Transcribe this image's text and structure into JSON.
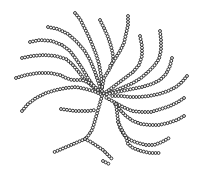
{
  "image": {
    "description": "Branched bead-chain (dendritic polymer) illustration on white background",
    "width": 202,
    "height": 170,
    "background": "#ffffff",
    "bead_stroke": "#2a2a2a",
    "bead_fill": "#ffffff",
    "bead_radius": 1.45,
    "bead_spacing": 3.0
  },
  "hub": [
    102,
    95
  ],
  "chains": [
    {
      "name": "upper-left-arc-1",
      "points": [
        [
          48,
          27
        ],
        [
          58,
          29
        ],
        [
          68,
          34
        ],
        [
          76,
          41
        ],
        [
          84,
          50
        ],
        [
          90,
          60
        ],
        [
          95,
          72
        ],
        [
          99,
          84
        ],
        [
          102,
          94
        ]
      ]
    },
    {
      "name": "upper-left-arc-2",
      "points": [
        [
          30,
          42
        ],
        [
          40,
          40
        ],
        [
          52,
          41
        ],
        [
          62,
          45
        ],
        [
          70,
          51
        ],
        [
          76,
          59
        ],
        [
          82,
          68
        ],
        [
          88,
          78
        ],
        [
          94,
          87
        ],
        [
          101,
          94
        ]
      ]
    },
    {
      "name": "upper-left-arc-3",
      "points": [
        [
          22,
          58
        ],
        [
          32,
          56
        ],
        [
          44,
          55
        ],
        [
          56,
          56
        ],
        [
          66,
          59
        ],
        [
          72,
          64
        ],
        [
          78,
          71
        ],
        [
          84,
          79
        ],
        [
          92,
          86
        ],
        [
          100,
          93
        ]
      ]
    },
    {
      "name": "upper-left-arc-4",
      "points": [
        [
          16,
          78
        ],
        [
          26,
          75
        ],
        [
          38,
          73
        ],
        [
          50,
          73
        ],
        [
          60,
          75
        ],
        [
          66,
          78
        ],
        [
          72,
          80
        ],
        [
          82,
          80
        ],
        [
          92,
          84
        ],
        [
          100,
          92
        ]
      ]
    },
    {
      "name": "lower-left-arc",
      "points": [
        [
          22,
          111
        ],
        [
          28,
          104
        ],
        [
          36,
          98
        ],
        [
          46,
          93
        ],
        [
          56,
          90
        ],
        [
          66,
          88
        ],
        [
          76,
          87
        ],
        [
          86,
          89
        ],
        [
          96,
          92
        ],
        [
          102,
          95
        ]
      ]
    },
    {
      "name": "top-chain-1",
      "points": [
        [
          75,
          13
        ],
        [
          80,
          19
        ],
        [
          84,
          27
        ],
        [
          88,
          35
        ],
        [
          92,
          44
        ],
        [
          96,
          54
        ],
        [
          99,
          64
        ],
        [
          101,
          75
        ],
        [
          102,
          86
        ],
        [
          102,
          94
        ]
      ]
    },
    {
      "name": "top-chain-2",
      "points": [
        [
          100,
          20
        ],
        [
          104,
          28
        ],
        [
          108,
          37
        ],
        [
          111,
          46
        ],
        [
          113,
          55
        ],
        [
          113,
          62
        ],
        [
          109,
          70
        ],
        [
          104,
          78
        ],
        [
          102,
          88
        ]
      ]
    },
    {
      "name": "top-chain-3",
      "points": [
        [
          128,
          16
        ],
        [
          128,
          25
        ],
        [
          126,
          34
        ],
        [
          124,
          43
        ],
        [
          120,
          51
        ],
        [
          115,
          59
        ],
        [
          110,
          66
        ]
      ]
    },
    {
      "name": "top-chain-4",
      "points": [
        [
          140,
          36
        ],
        [
          142,
          46
        ],
        [
          142,
          56
        ],
        [
          139,
          65
        ],
        [
          133,
          72
        ],
        [
          125,
          78
        ],
        [
          117,
          84
        ],
        [
          109,
          90
        ],
        [
          103,
          94
        ]
      ]
    },
    {
      "name": "top-chain-5",
      "points": [
        [
          160,
          31
        ],
        [
          161,
          40
        ],
        [
          161,
          50
        ],
        [
          159,
          59
        ],
        [
          154,
          66
        ],
        [
          148,
          72
        ],
        [
          141,
          78
        ],
        [
          133,
          83
        ],
        [
          124,
          87
        ],
        [
          114,
          91
        ],
        [
          104,
          95
        ]
      ]
    },
    {
      "name": "right-chain-1",
      "points": [
        [
          172,
          58
        ],
        [
          170,
          66
        ],
        [
          166,
          74
        ],
        [
          160,
          80
        ],
        [
          152,
          84
        ],
        [
          142,
          87
        ],
        [
          132,
          89
        ],
        [
          122,
          91
        ],
        [
          112,
          93
        ],
        [
          104,
          95
        ]
      ]
    },
    {
      "name": "right-chain-2",
      "points": [
        [
          187,
          76
        ],
        [
          182,
          82
        ],
        [
          176,
          87
        ],
        [
          168,
          91
        ],
        [
          159,
          94
        ],
        [
          149,
          96
        ],
        [
          139,
          97
        ],
        [
          130,
          97
        ],
        [
          121,
          96
        ],
        [
          112,
          96
        ]
      ]
    },
    {
      "name": "right-chain-3",
      "points": [
        [
          184,
          98
        ],
        [
          178,
          102
        ],
        [
          170,
          106
        ],
        [
          161,
          109
        ],
        [
          151,
          112
        ],
        [
          141,
          112
        ],
        [
          132,
          111
        ],
        [
          123,
          107
        ],
        [
          114,
          102
        ],
        [
          105,
          97
        ]
      ]
    },
    {
      "name": "right-chain-4",
      "points": [
        [
          184,
          116
        ],
        [
          177,
          120
        ],
        [
          168,
          123
        ],
        [
          159,
          125
        ],
        [
          150,
          125
        ],
        [
          141,
          124
        ],
        [
          133,
          121
        ],
        [
          126,
          116
        ],
        [
          120,
          110
        ],
        [
          115,
          104
        ]
      ]
    },
    {
      "name": "lower-right-chain-1",
      "points": [
        [
          116,
          104
        ],
        [
          117,
          112
        ],
        [
          118,
          120
        ],
        [
          120,
          128
        ],
        [
          124,
          135
        ],
        [
          130,
          140
        ],
        [
          138,
          143
        ],
        [
          146,
          145
        ],
        [
          154,
          145
        ],
        [
          162,
          142
        ],
        [
          169,
          138
        ]
      ]
    },
    {
      "name": "lower-right-chain-2",
      "points": [
        [
          118,
          122
        ],
        [
          122,
          130
        ],
        [
          126,
          137
        ],
        [
          128,
          144
        ],
        [
          133,
          148
        ],
        [
          141,
          151
        ],
        [
          150,
          153
        ],
        [
          160,
          153
        ]
      ]
    },
    {
      "name": "left-middle-chain",
      "points": [
        [
          61,
          109
        ],
        [
          68,
          110
        ],
        [
          75,
          111
        ],
        [
          82,
          111
        ],
        [
          89,
          111
        ],
        [
          95,
          110
        ]
      ]
    },
    {
      "name": "center-down-chain",
      "points": [
        [
          102,
          96
        ],
        [
          100,
          103
        ],
        [
          98,
          110
        ],
        [
          96,
          117
        ],
        [
          94,
          124
        ],
        [
          92,
          130
        ],
        [
          88,
          136
        ],
        [
          85,
          139
        ]
      ]
    },
    {
      "name": "lower-left-branch",
      "points": [
        [
          85,
          139
        ],
        [
          78,
          142
        ],
        [
          71,
          145
        ],
        [
          64,
          148
        ],
        [
          57,
          151
        ],
        [
          52,
          153
        ]
      ]
    },
    {
      "name": "lower-right-branch",
      "points": [
        [
          85,
          139
        ],
        [
          91,
          142
        ],
        [
          97,
          146
        ],
        [
          103,
          150
        ],
        [
          108,
          155
        ],
        [
          113,
          160
        ]
      ]
    },
    {
      "name": "bottom-stray",
      "points": [
        [
          103,
          161
        ],
        [
          107,
          163
        ],
        [
          111,
          165
        ]
      ]
    }
  ]
}
